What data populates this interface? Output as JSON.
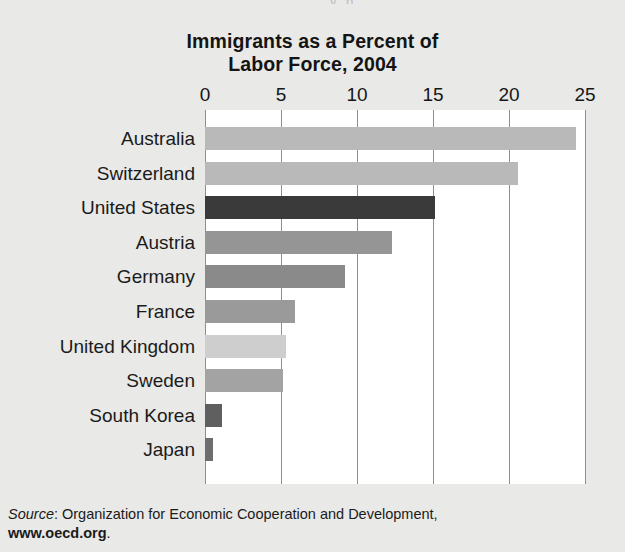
{
  "figure": {
    "title_line1": "Immigrants as a Percent of",
    "title_line2": "Labor Force, 2004",
    "top_artifact": "y p",
    "source_prefix": "Source",
    "source_separator": ": ",
    "source_text": "Organization for Economic Cooperation and Development,",
    "source_url": "www.oecd.org",
    "source_period": "."
  },
  "colors": {
    "page_background": "#e9e9e7",
    "plot_background": "#ffffff",
    "gridline": "#8e8e8e",
    "text": "#1b1b1b",
    "title": "#141414"
  },
  "chart_data": {
    "type": "bar",
    "orientation": "horizontal",
    "title": "Immigrants as a Percent of Labor Force, 2004",
    "xlabel": "",
    "ylabel": "",
    "xlim": [
      0,
      25
    ],
    "xticks": [
      0,
      5,
      10,
      15,
      20,
      25
    ],
    "xtick_labels": [
      "0",
      "5",
      "10",
      "15",
      "20",
      "25"
    ],
    "grid": "vertical",
    "legend": "none",
    "units": "percent of labor force",
    "categories": [
      "Australia",
      "Switzerland",
      "United States",
      "Austria",
      "Germany",
      "France",
      "United Kingdom",
      "Sweden",
      "South Korea",
      "Japan"
    ],
    "values": [
      24.4,
      20.6,
      15.1,
      12.3,
      9.2,
      5.9,
      5.3,
      5.1,
      1.1,
      0.5
    ],
    "bar_colors": [
      "#b9b9b9",
      "#b9b9b9",
      "#3a3a3a",
      "#959595",
      "#8a8a8a",
      "#9a9a9a",
      "#cecece",
      "#a3a3a3",
      "#5f5f5f",
      "#6d6d6d"
    ]
  }
}
